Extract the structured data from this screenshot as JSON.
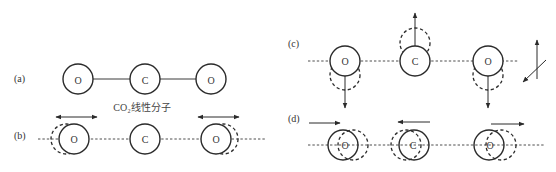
{
  "figure": {
    "panels": [
      {
        "id": "a",
        "label": "(a)",
        "description": "linear CO2 molecule at rest",
        "atoms": [
          {
            "symbol": "O"
          },
          {
            "symbol": "C"
          },
          {
            "symbol": "O"
          }
        ],
        "caption": "CO₂线性分子"
      },
      {
        "id": "b",
        "label": "(b)",
        "description": "symmetric stretching vibration",
        "atoms": [
          {
            "symbol": "O",
            "motion": "left"
          },
          {
            "symbol": "C",
            "motion": "none"
          },
          {
            "symbol": "O",
            "motion": "right"
          }
        ]
      },
      {
        "id": "c",
        "label": "(c)",
        "description": "bending vibration",
        "atoms": [
          {
            "symbol": "O",
            "motion": "down"
          },
          {
            "symbol": "C",
            "motion": "up"
          },
          {
            "symbol": "O",
            "motion": "down"
          }
        ]
      },
      {
        "id": "d",
        "label": "(d)",
        "description": "asymmetric stretching vibration",
        "atoms": [
          {
            "symbol": "O",
            "motion": "right"
          },
          {
            "symbol": "C",
            "motion": "left"
          },
          {
            "symbol": "O",
            "motion": "right"
          }
        ]
      }
    ],
    "colors": {
      "stroke": "#2a2a2a",
      "background": "#ffffff"
    }
  }
}
